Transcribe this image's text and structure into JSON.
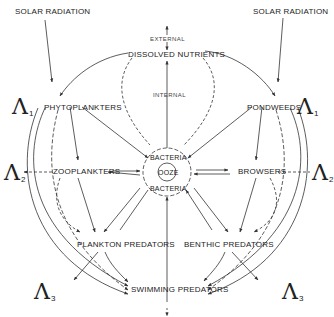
{
  "diagram": {
    "type": "food-web / nutrient cycle",
    "nodes": {
      "solar_left": "SOLAR RADIATION",
      "solar_right": "SOLAR RADIATION",
      "external": "EXTERNAL",
      "dissolved_nutrients": "DISSOLVED NUTRIENTS",
      "internal": "INTERNAL",
      "phytoplankters": "PHYTOPLANKTERS",
      "pondweeds": "PONDWEEDS",
      "zooplankters": "ZOOPLANKTERS",
      "browsers": "BROWSERS",
      "bacteria_top": "BACTERIA",
      "ooze": "OOZE",
      "bacteria_bottom": "BACTERIA",
      "plankton_predators": "PLANKTON PREDATORS",
      "benthic_predators": "BENTHIC PREDATORS",
      "swimming_predators": "SWIMMING PREDATORS"
    },
    "lambdas": {
      "l1_left": {
        "symbol": "Λ",
        "sub": "1"
      },
      "l1_right": {
        "symbol": "Λ",
        "sub": "1"
      },
      "l2_left": {
        "symbol": "Λ",
        "sub": "2"
      },
      "l2_right": {
        "symbol": "Λ",
        "sub": "2"
      },
      "l3_left": {
        "symbol": "Λ",
        "sub": "3"
      },
      "l3_right": {
        "symbol": "Λ",
        "sub": "3"
      }
    },
    "edges": [
      {
        "from": "SOLAR RADIATION",
        "to": "PHYTOPLANKTERS",
        "style": "solid"
      },
      {
        "from": "SOLAR RADIATION",
        "to": "PONDWEEDS",
        "style": "solid"
      },
      {
        "from": "DISSOLVED NUTRIENTS",
        "to": "PHYTOPLANKTERS",
        "style": "solid"
      },
      {
        "from": "DISSOLVED NUTRIENTS",
        "to": "PONDWEEDS",
        "style": "solid"
      },
      {
        "from": "OOZE/BACTERIA",
        "to": "DISSOLVED NUTRIENTS",
        "style": "solid",
        "label": "INTERNAL"
      },
      {
        "from": "EXTERNAL",
        "to": "DISSOLVED NUTRIENTS",
        "style": "solid"
      },
      {
        "from": "PHYTOPLANKTERS",
        "to": "ZOOPLANKTERS",
        "style": "solid"
      },
      {
        "from": "PHYTOPLANKTERS",
        "to": "BACTERIA",
        "style": "solid"
      },
      {
        "from": "PONDWEEDS",
        "to": "BROWSERS",
        "style": "solid"
      },
      {
        "from": "PONDWEEDS",
        "to": "BACTERIA",
        "style": "solid"
      },
      {
        "from": "ZOOPLANKTERS",
        "to": "BACTERIA",
        "style": "solid"
      },
      {
        "from": "BACTERIA",
        "to": "ZOOPLANKTERS",
        "style": "solid"
      },
      {
        "from": "BROWSERS",
        "to": "BACTERIA",
        "style": "solid"
      },
      {
        "from": "BACTERIA",
        "to": "BROWSERS",
        "style": "solid"
      },
      {
        "from": "ZOOPLANKTERS",
        "to": "PLANKTON PREDATORS",
        "style": "solid"
      },
      {
        "from": "BROWSERS",
        "to": "BENTHIC PREDATORS",
        "style": "solid"
      },
      {
        "from": "PLANKTON PREDATORS",
        "to": "SWIMMING PREDATORS",
        "style": "solid"
      },
      {
        "from": "BENTHIC PREDATORS",
        "to": "SWIMMING PREDATORS",
        "style": "solid"
      },
      {
        "from": "PLANKTON PREDATORS",
        "to": "BACTERIA",
        "style": "solid"
      },
      {
        "from": "BENTHIC PREDATORS",
        "to": "BACTERIA",
        "style": "solid"
      },
      {
        "from": "SWIMMING PREDATORS",
        "to": "BACTERIA",
        "style": "solid"
      },
      {
        "from": "ZOOPLANKTERS",
        "to": "Λ2",
        "style": "dashed"
      },
      {
        "from": "BROWSERS",
        "to": "Λ2",
        "style": "dashed"
      },
      {
        "from": "DISSOLVED NUTRIENTS",
        "to": "BACTERIA",
        "style": "dashed"
      },
      {
        "from": "SWIMMING PREDATORS",
        "to": "outflow",
        "style": "dashed"
      }
    ]
  }
}
